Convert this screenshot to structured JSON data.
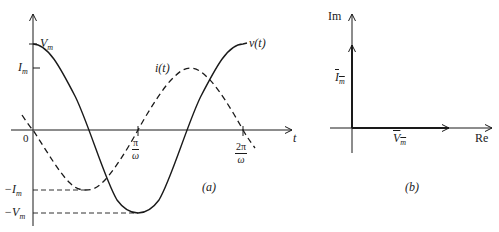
{
  "figure_a": {
    "caption": "(a)",
    "axis_labels": {
      "time": "t",
      "origin": "0"
    },
    "y_ticks": {
      "vm_pos": "V",
      "im_pos": "I",
      "im_neg": "−I",
      "vm_neg": "−V",
      "subscript": "m"
    },
    "x_ticks": [
      {
        "num": "π",
        "den": "ω"
      },
      {
        "num": "2π",
        "den": "ω"
      }
    ],
    "curves": [
      {
        "name": "v(t)",
        "style": "solid",
        "function": "Vm·cos(ωt)"
      },
      {
        "name": "i(t)",
        "style": "dashed",
        "function": "Im·cos(ωt + 90°)"
      }
    ]
  },
  "figure_b": {
    "caption": "(b)",
    "axis_labels": {
      "imag": "Im",
      "real": "Re"
    },
    "phasors": [
      {
        "name": "I",
        "sub": "m",
        "direction": "imaginary"
      },
      {
        "name": "V",
        "sub": "m",
        "direction": "real"
      }
    ]
  },
  "colors": {
    "ink": "#1a1a1a",
    "background": "#ffffff"
  }
}
